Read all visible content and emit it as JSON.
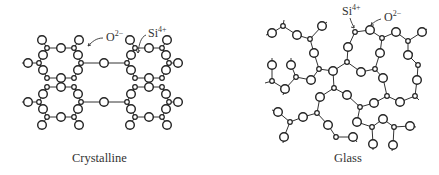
{
  "panels": [
    {
      "id": "crystalline",
      "caption": "Crystalline",
      "labels": {
        "oxygen": {
          "symbol": "O",
          "charge": "2−"
        },
        "silicon": {
          "symbol": "Si",
          "charge": "4+"
        }
      }
    },
    {
      "id": "glass",
      "caption": "Glass",
      "labels": {
        "oxygen": {
          "symbol": "O",
          "charge": "2−"
        },
        "silicon": {
          "symbol": "Si",
          "charge": "4+"
        }
      }
    }
  ],
  "legend": {
    "large_circle": "O2− (oxygen ion)",
    "small_circle": "Si4+ (silicon ion)"
  }
}
